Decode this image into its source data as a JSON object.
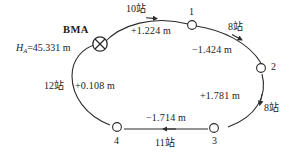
{
  "figure": {
    "type": "closed-loop-leveling-traverse",
    "benchmark": {
      "name": "BMA",
      "height_symbol": "H",
      "height_subscript": "A",
      "height_equals": "=45.331 m",
      "height_full": "H_A=45.331 m",
      "value": 45.331,
      "unit": "m",
      "symbol": "circle-with-x"
    },
    "nodes": [
      {
        "id": "1",
        "label": "1"
      },
      {
        "id": "2",
        "label": "2"
      },
      {
        "id": "3",
        "label": "3"
      },
      {
        "id": "4",
        "label": "4"
      }
    ],
    "segments": [
      {
        "from": "BMA",
        "to": "1",
        "stations": "10站",
        "station_count": 10,
        "height_difference": "+1.224 m",
        "value": 1.224,
        "direction": "right"
      },
      {
        "from": "1",
        "to": "2",
        "stations": "8站",
        "station_count": 8,
        "height_difference": "−1.424 m",
        "value": -1.424,
        "direction": "down-right"
      },
      {
        "from": "2",
        "to": "3",
        "stations": "8站",
        "station_count": 8,
        "height_difference": "+1.781 m",
        "value": 1.781,
        "direction": "down-left"
      },
      {
        "from": "3",
        "to": "4",
        "stations": "11站",
        "station_count": 11,
        "height_difference": "−1.714 m",
        "value": -1.714,
        "direction": "left"
      },
      {
        "from": "4",
        "to": "BMA",
        "stations": "12站",
        "station_count": 12,
        "height_difference": "+0.108 m",
        "value": 0.108,
        "direction": "up"
      }
    ],
    "colors": {
      "line": "#2b2b2b",
      "text": "#1a1a1a",
      "background": "#ffffff"
    }
  }
}
